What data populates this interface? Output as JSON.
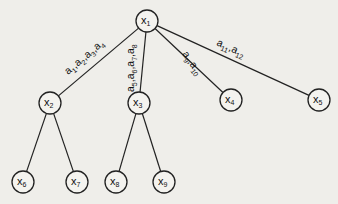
{
  "diagram": {
    "type": "tree",
    "nodes": [
      {
        "id": "x1",
        "base": "x",
        "sub": "1",
        "cx": 147,
        "cy": 21
      },
      {
        "id": "x2",
        "base": "x",
        "sub": "2",
        "cx": 50,
        "cy": 103
      },
      {
        "id": "x3",
        "base": "x",
        "sub": "3",
        "cx": 139,
        "cy": 103
      },
      {
        "id": "x4",
        "base": "x",
        "sub": "4",
        "cx": 231,
        "cy": 100
      },
      {
        "id": "x5",
        "base": "x",
        "sub": "5",
        "cx": 319,
        "cy": 100
      },
      {
        "id": "x6",
        "base": "x",
        "sub": "6",
        "cx": 23,
        "cy": 182
      },
      {
        "id": "x7",
        "base": "x",
        "sub": "7",
        "cx": 77,
        "cy": 182
      },
      {
        "id": "x8",
        "base": "x",
        "sub": "8",
        "cx": 116,
        "cy": 182
      },
      {
        "id": "x9",
        "base": "x",
        "sub": "9",
        "cx": 164,
        "cy": 182
      }
    ],
    "edges": [
      {
        "from": "x1",
        "to": "x2",
        "label": "a1,a2,a3,a4"
      },
      {
        "from": "x1",
        "to": "x3",
        "label": "a5,a6,a7,a8"
      },
      {
        "from": "x1",
        "to": "x4",
        "label": "a9,a10"
      },
      {
        "from": "x1",
        "to": "x5",
        "label": "a11,a12"
      },
      {
        "from": "x2",
        "to": "x6",
        "label": ""
      },
      {
        "from": "x2",
        "to": "x7",
        "label": ""
      },
      {
        "from": "x3",
        "to": "x8",
        "label": ""
      },
      {
        "from": "x3",
        "to": "x9",
        "label": ""
      }
    ],
    "edge_labels": {
      "x1_x2": [
        {
          "b": "a",
          "s": "1"
        },
        {
          "b": "a",
          "s": "2"
        },
        {
          "b": "a",
          "s": "3"
        },
        {
          "b": "a",
          "s": "4"
        }
      ],
      "x1_x3": [
        {
          "b": "a",
          "s": "5"
        },
        {
          "b": "a",
          "s": "6"
        },
        {
          "b": "a",
          "s": "7"
        },
        {
          "b": "a",
          "s": "8"
        }
      ],
      "x1_x4": [
        {
          "b": "a",
          "s": "9"
        },
        {
          "b": "a",
          "s": "10"
        }
      ],
      "x1_x5": [
        {
          "b": "a",
          "s": "11"
        },
        {
          "b": "a",
          "s": "12"
        }
      ]
    },
    "node_radius": 11,
    "colors": {
      "line": "#222222",
      "background": "#efeeea"
    }
  }
}
